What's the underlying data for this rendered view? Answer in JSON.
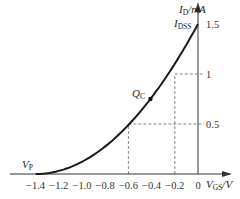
{
  "chart_data": {
    "type": "line",
    "title": "",
    "xlabel": "V_GS/V",
    "ylabel": "I_D/mA",
    "xlim": [
      -1.4,
      0
    ],
    "ylim": [
      0,
      1.5
    ],
    "x_ticks": [
      "-1.4",
      "-1.2",
      "-1.0",
      "-0.8",
      "-0.6",
      "-0.4",
      "-0.2",
      "0"
    ],
    "y_ticks": [
      "0.5",
      "1",
      "1.5"
    ],
    "series": [
      {
        "name": "I_D = I_DSS(1 - V_GS/V_P)^2",
        "x": [
          -1.4,
          -1.2,
          -1.0,
          -0.8,
          -0.6,
          -0.4,
          -0.2,
          0
        ],
        "values": [
          0,
          0.03,
          0.12,
          0.28,
          0.49,
          0.77,
          1.1,
          1.5
        ]
      }
    ],
    "annotations": [
      {
        "text": "V_P",
        "x": -1.4,
        "y": 0
      },
      {
        "text": "I_DSS",
        "x": 0,
        "y": 1.5
      },
      {
        "text": "Q_C",
        "x": -0.41,
        "y": 0.75
      }
    ],
    "guides": [
      {
        "x": -0.6,
        "y": 0.5,
        "style": "dashed"
      },
      {
        "x": -0.2,
        "y": 1.0,
        "style": "dashed"
      }
    ],
    "grid": false,
    "legend": "none"
  },
  "labels": {
    "y_axis_main": "I",
    "y_axis_sub": "D",
    "y_axis_unit": "/mA",
    "x_axis_main": "V",
    "x_axis_sub": "GS",
    "x_axis_unit": "/V",
    "idss_main": "I",
    "idss_sub": "DSS",
    "vp_main": "V",
    "vp_sub": "P",
    "q_main": "Q",
    "q_sub": "C"
  }
}
